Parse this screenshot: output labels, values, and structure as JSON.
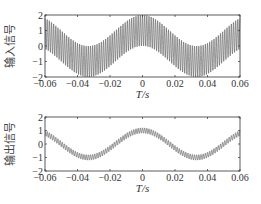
{
  "chart_data": [
    {
      "type": "line",
      "title": "",
      "xlabel": "T/s",
      "ylabel": "输入信号",
      "xlim": [
        -0.06,
        0.06
      ],
      "ylim": [
        -2,
        2
      ],
      "xticks": [
        "-0.06",
        "-0.04",
        "-0.02",
        "0",
        "0.02",
        "0.04",
        "0.06"
      ],
      "yticks": [
        "2",
        "1",
        "0",
        "-1",
        "-2"
      ],
      "grid": false,
      "series": [
        {
          "name": "input",
          "description": "Low-frequency cosine (~15 Hz, amplitude 1) plus high-frequency oscillation (~750 Hz, amplitude 1)",
          "lf_freq_hz": 15,
          "lf_amp": 1,
          "hf_freq_hz": 750,
          "hf_amp": 1
        }
      ]
    },
    {
      "type": "line",
      "title": "",
      "xlabel": "T/s",
      "ylabel": "输出信号",
      "xlim": [
        -0.06,
        0.06
      ],
      "ylim": [
        -2,
        2
      ],
      "xticks": [
        "-0.06",
        "-0.04",
        "-0.02",
        "0",
        "0.02",
        "0.04",
        "0.06"
      ],
      "yticks": [
        "2",
        "1",
        "0",
        "-1",
        "-2"
      ],
      "grid": false,
      "series": [
        {
          "name": "output",
          "description": "Low-frequency cosine (~15 Hz, amplitude ~1) with attenuated high-frequency ripple (~750 Hz, amplitude ~0.2)",
          "lf_freq_hz": 15,
          "lf_amp": 1,
          "hf_freq_hz": 750,
          "hf_amp": 0.2
        }
      ]
    }
  ],
  "plots": [
    {
      "ylabel": "输入信号",
      "xlabel": "T/s"
    },
    {
      "ylabel": "输出信号",
      "xlabel": "T/s"
    }
  ]
}
